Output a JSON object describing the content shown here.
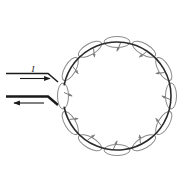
{
  "figure": {
    "type": "physics-diagram",
    "background_color": "#ffffff",
    "loop": {
      "name": "current-loop",
      "shape": "circle",
      "center_x": 117,
      "center_y": 96,
      "radius": 54,
      "stroke_color": "#2b2b2b",
      "stroke_width": 1.6,
      "gap_start_deg": 168,
      "gap_end_deg": 192
    },
    "field_loops": {
      "name": "magnetic-field-lines",
      "count": 12,
      "stroke_color": "#8a8a8a",
      "stroke_width": 1.0,
      "arrow_color": "#7a7a7a",
      "rx": 13,
      "ry": 5.5,
      "angles_deg": [
        210,
        240,
        270,
        300,
        330,
        0,
        30,
        60,
        90,
        120,
        150,
        180
      ]
    },
    "leads": {
      "name": "lead-wires",
      "stroke_color": "#1a1a1a",
      "top": {
        "label": "I",
        "direction": "right",
        "y": 73,
        "x_start": 6,
        "x_end": 57,
        "arrow_y": 76,
        "arrow_x_start": 20,
        "arrow_x_end": 50,
        "label_x": 33,
        "label_y": 70
      },
      "bottom": {
        "label": "",
        "direction": "left",
        "y": 95,
        "x_start": 6,
        "x_end": 57,
        "arrow_y": 102,
        "arrow_x_start": 42,
        "arrow_x_end": 12
      }
    }
  }
}
